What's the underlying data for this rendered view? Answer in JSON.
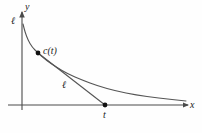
{
  "figure": {
    "kind": "math-diagram",
    "background_color": "#fefefe",
    "stroke_color": "#555555",
    "axis_color": "#4a4a4a",
    "text_color": "#1c1c1c",
    "width": 202,
    "height": 133
  },
  "axes": {
    "y_label": "y",
    "x_label": "x",
    "origin_x": 22,
    "origin_y": 105,
    "x_axis_end": 188,
    "y_axis_top": 10
  },
  "labels": {
    "curve_start_label": "ℓ",
    "chord_label": "ℓ",
    "point_on_curve_label": "c(t)",
    "point_on_axis_label": "t"
  },
  "points": [
    {
      "name": "point-c-of-t",
      "label": "c(t)",
      "x": 38,
      "y": 53
    },
    {
      "name": "point-t",
      "label": "t",
      "x": 105,
      "y": 105
    }
  ],
  "curve": {
    "description": "decaying convex curve from y-axis top to lower right",
    "start": [
      23,
      24
    ],
    "end": [
      186,
      101
    ],
    "points": [
      [
        23,
        24
      ],
      [
        25,
        32
      ],
      [
        28,
        40
      ],
      [
        32,
        47
      ],
      [
        38,
        53
      ],
      [
        46,
        60
      ],
      [
        56,
        67
      ],
      [
        68,
        74
      ],
      [
        82,
        80
      ],
      [
        98,
        86
      ],
      [
        116,
        91
      ],
      [
        136,
        95
      ],
      [
        158,
        98
      ],
      [
        186,
        101
      ]
    ]
  },
  "chord": {
    "description": "straight segment from c(t) to t on the x-axis",
    "from": [
      38,
      53
    ],
    "to": [
      105,
      105
    ]
  },
  "chart_data": {
    "type": "line",
    "title": "",
    "xlabel": "x",
    "ylabel": "y",
    "grid": false,
    "legend": "none",
    "series": [
      {
        "name": "curve",
        "x": [
          0.0,
          0.02,
          0.04,
          0.07,
          0.1,
          0.15,
          0.21,
          0.28,
          0.37,
          0.47,
          0.58,
          0.7,
          0.83,
          1.0
        ],
        "y": [
          1.0,
          0.9,
          0.8,
          0.72,
          0.64,
          0.56,
          0.47,
          0.38,
          0.31,
          0.24,
          0.17,
          0.12,
          0.09,
          0.05
        ]
      },
      {
        "name": "chord",
        "x": [
          0.1,
          0.51
        ],
        "y": [
          0.64,
          0.0
        ]
      }
    ],
    "annotations": [
      {
        "text": "c(t)",
        "x": 0.1,
        "y": 0.64
      },
      {
        "text": "t",
        "x": 0.51,
        "y": 0.0
      },
      {
        "text": "ℓ",
        "x": 0.0,
        "y": 1.0
      },
      {
        "text": "ℓ",
        "x": 0.27,
        "y": 0.3
      }
    ]
  }
}
